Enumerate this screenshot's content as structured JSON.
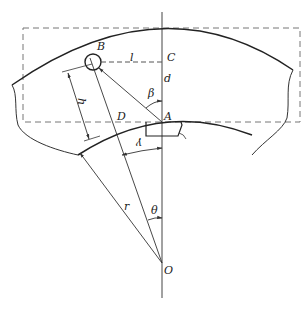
{
  "diagram": {
    "type": "geometric-technical-drawing",
    "labels": {
      "B": "B",
      "C": "C",
      "l": "l",
      "d": "d",
      "beta": "β",
      "h": "h",
      "D": "D",
      "A": "A",
      "gamma": "γ",
      "r": "r",
      "theta": "θ",
      "O": "O"
    },
    "colors": {
      "line": "#333333",
      "dashed": "#777777",
      "background": "#ffffff"
    }
  }
}
